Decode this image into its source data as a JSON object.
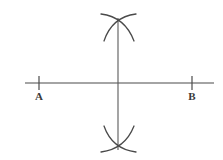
{
  "figure": {
    "kind": "geometry-construction",
    "width": 223,
    "height": 160,
    "background_color": "#ffffff",
    "stroke_color": "#4a4a4a",
    "label_color": "#3a3a3a"
  },
  "chart_data": {
    "type": "diagram",
    "title": "",
    "xlabel": "",
    "ylabel": "",
    "elements": [
      {
        "name": "baseline",
        "kind": "line",
        "x1": 25,
        "y1": 83,
        "x2": 214,
        "y2": 83
      },
      {
        "name": "perpendicular-line",
        "kind": "line",
        "x1": 118,
        "y1": 18,
        "x2": 118,
        "y2": 150
      },
      {
        "name": "tick-a",
        "kind": "line",
        "x1": 39,
        "y1": 76,
        "x2": 39,
        "y2": 90
      },
      {
        "name": "tick-b",
        "kind": "line",
        "x1": 192,
        "y1": 76,
        "x2": 192,
        "y2": 90
      },
      {
        "name": "upper-arc-left",
        "kind": "arc",
        "x1": 104,
        "y1": 41,
        "cx": 112,
        "cy": 17,
        "x2": 136,
        "y2": 14
      },
      {
        "name": "upper-arc-right",
        "kind": "arc",
        "x1": 134,
        "y1": 41,
        "cx": 125,
        "cy": 17,
        "x2": 101,
        "y2": 14
      },
      {
        "name": "lower-arc-left",
        "kind": "arc",
        "x1": 104,
        "y1": 126,
        "cx": 112,
        "cy": 149,
        "x2": 136,
        "y2": 152
      },
      {
        "name": "lower-arc-right",
        "kind": "arc",
        "x1": 134,
        "y1": 126,
        "cx": 125,
        "cy": 149,
        "x2": 101,
        "y2": 152
      }
    ],
    "point_labels": [
      {
        "text": "A",
        "x": 39,
        "y": 99
      },
      {
        "text": "B",
        "x": 192,
        "y": 99
      }
    ]
  },
  "labels": {
    "point_a": "A",
    "point_b": "B"
  }
}
